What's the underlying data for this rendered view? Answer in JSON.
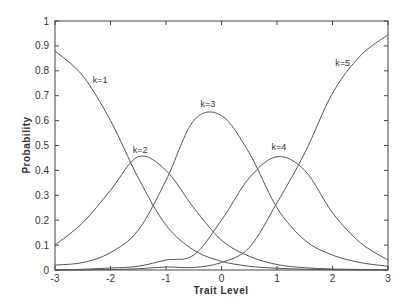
{
  "chart_data": {
    "type": "line",
    "title": "",
    "xlabel": "Trait Level",
    "ylabel": "Probability",
    "xlim": [
      -3,
      3
    ],
    "ylim": [
      0,
      1
    ],
    "grid": false,
    "legend": "none (inline curve labels)",
    "x_ticks": [
      -3,
      -2,
      -1,
      0,
      1,
      2,
      3
    ],
    "x_tick_labels": [
      "-3",
      "-2",
      "-1",
      "0",
      "1",
      "2",
      "3"
    ],
    "y_ticks": [
      0,
      0.1,
      0.2,
      0.3,
      0.4,
      0.5,
      0.6,
      0.7,
      0.8,
      0.9,
      1
    ],
    "y_tick_labels": [
      "0",
      "0.1",
      "0.2",
      "0.3",
      "0.4",
      "0.5",
      "0.6",
      "0.7",
      "0.8",
      "0.9",
      "1"
    ],
    "x": [
      -3,
      -2.5,
      -2,
      -1.5,
      -1,
      -0.5,
      0,
      0.5,
      1,
      1.5,
      2,
      2.5,
      3
    ],
    "series": [
      {
        "name": "k=1",
        "values": [
          0.88,
          0.78,
          0.6,
          0.37,
          0.18,
          0.08,
          0.035,
          0.015,
          0.007,
          0.003,
          0.001,
          0.0,
          0.0
        ],
        "label_pos": [
          -2.32,
          0.75
        ]
      },
      {
        "name": "k=2",
        "values": [
          0.1,
          0.19,
          0.32,
          0.455,
          0.4,
          0.25,
          0.12,
          0.055,
          0.022,
          0.009,
          0.004,
          0.002,
          0.001
        ],
        "label_pos": [
          -1.6,
          0.47
        ]
      },
      {
        "name": "k=3",
        "values": [
          0.02,
          0.03,
          0.07,
          0.16,
          0.36,
          0.6,
          0.62,
          0.47,
          0.25,
          0.12,
          0.06,
          0.03,
          0.015
        ],
        "label_pos": [
          -0.38,
          0.655
        ]
      },
      {
        "name": "k=4",
        "values": [
          0.0,
          0.003,
          0.008,
          0.015,
          0.04,
          0.06,
          0.2,
          0.37,
          0.455,
          0.4,
          0.23,
          0.11,
          0.04
        ],
        "label_pos": [
          0.9,
          0.48
        ]
      },
      {
        "name": "k=5",
        "values": [
          0.0,
          0.0,
          0.002,
          0.005,
          0.012,
          0.01,
          0.03,
          0.09,
          0.27,
          0.47,
          0.71,
          0.86,
          0.945
        ],
        "label_pos": [
          2.05,
          0.82
        ]
      }
    ]
  },
  "colors": {
    "line": "#555555",
    "frame": "#444444",
    "text": "#333333",
    "background": "#ffffff"
  }
}
